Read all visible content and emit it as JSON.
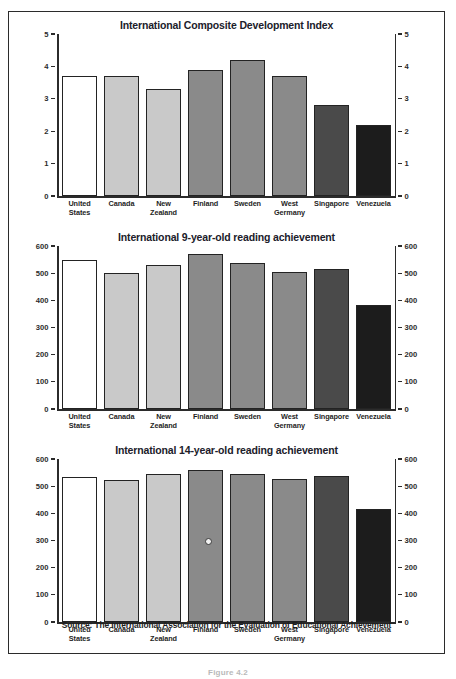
{
  "figure": {
    "source_note": "Source: The International Association for the Evaluation of Educational Achievement",
    "caption": "Figure 4.2",
    "frame_color": "#2b2b2b",
    "background": "#ffffff"
  },
  "series_colors": {
    "white": "#ffffff",
    "light_gray": "#c9c9c9",
    "medium_gray": "#8a8a8a",
    "dark_gray": "#4a4a4a",
    "near_black": "#1c1c1c",
    "bar_outline": "#232323"
  },
  "chart_data": [
    {
      "type": "bar",
      "id": "composite-development-index",
      "title": "International Composite Development Index",
      "xlabel": "",
      "ylabel": "",
      "ylim": [
        0,
        5
      ],
      "yticks": [
        0,
        1,
        2,
        3,
        4,
        5
      ],
      "ytick_labels": [
        "0",
        "1",
        "2",
        "3",
        "4",
        "5"
      ],
      "dual_axis": true,
      "grid": false,
      "legend": "none",
      "categories": [
        "United States",
        "Canada",
        "New Zealand",
        "Finland",
        "Sweden",
        "West Germany",
        "Singapore",
        "Venezuela"
      ],
      "category_lines": [
        [
          "United",
          "States"
        ],
        [
          "Canada"
        ],
        [
          "New",
          "Zealand"
        ],
        [
          "Finland"
        ],
        [
          "Sweden"
        ],
        [
          "West",
          "Germany"
        ],
        [
          "Singapore"
        ],
        [
          "Venezuela"
        ]
      ],
      "values": [
        3.7,
        3.7,
        3.3,
        3.9,
        4.2,
        3.7,
        2.8,
        2.2
      ],
      "bar_colors": [
        "#ffffff",
        "#c9c9c9",
        "#c9c9c9",
        "#8a8a8a",
        "#8a8a8a",
        "#8a8a8a",
        "#4a4a4a",
        "#1c1c1c"
      ]
    },
    {
      "type": "bar",
      "id": "reading-achievement-9",
      "title": "International 9-year-old reading achievement",
      "xlabel": "",
      "ylabel": "",
      "ylim": [
        0,
        600
      ],
      "yticks": [
        0,
        100,
        200,
        300,
        400,
        500,
        600
      ],
      "ytick_labels": [
        "0",
        "100",
        "200",
        "300",
        "400",
        "500",
        "600"
      ],
      "dual_axis": true,
      "grid": false,
      "legend": "none",
      "categories": [
        "United States",
        "Canada",
        "New Zealand",
        "Finland",
        "Sweden",
        "West Germany",
        "Singapore",
        "Venezuela"
      ],
      "category_lines": [
        [
          "United",
          "States"
        ],
        [
          "Canada"
        ],
        [
          "New",
          "Zealand"
        ],
        [
          "Finland"
        ],
        [
          "Sweden"
        ],
        [
          "West",
          "Germany"
        ],
        [
          "Singapore"
        ],
        [
          "Venezuela"
        ]
      ],
      "values": [
        547,
        500,
        530,
        569,
        539,
        505,
        515,
        383
      ],
      "bar_colors": [
        "#ffffff",
        "#c9c9c9",
        "#c9c9c9",
        "#8a8a8a",
        "#8a8a8a",
        "#8a8a8a",
        "#4a4a4a",
        "#1c1c1c"
      ]
    },
    {
      "type": "bar",
      "id": "reading-achievement-14",
      "title": "International 14-year-old reading achievement",
      "xlabel": "",
      "ylabel": "",
      "ylim": [
        0,
        600
      ],
      "yticks": [
        0,
        100,
        200,
        300,
        400,
        500,
        600
      ],
      "ytick_labels": [
        "0",
        "100",
        "200",
        "300",
        "400",
        "500",
        "600"
      ],
      "dual_axis": true,
      "grid": false,
      "legend": "none",
      "categories": [
        "United States",
        "Canada",
        "New Zealand",
        "Finland",
        "Sweden",
        "West Germany",
        "Singapore",
        "Venezuela"
      ],
      "category_lines": [
        [
          "United",
          "States"
        ],
        [
          "Canada"
        ],
        [
          "New",
          "Zealand"
        ],
        [
          "Finland"
        ],
        [
          "Sweden"
        ],
        [
          "West",
          "Germany"
        ],
        [
          "Singapore"
        ],
        [
          "Venezuela"
        ]
      ],
      "values": [
        535,
        522,
        545,
        560,
        546,
        525,
        539,
        417
      ],
      "bar_colors": [
        "#ffffff",
        "#c9c9c9",
        "#c9c9c9",
        "#8a8a8a",
        "#8a8a8a",
        "#8a8a8a",
        "#4a4a4a",
        "#1c1c1c"
      ]
    }
  ]
}
